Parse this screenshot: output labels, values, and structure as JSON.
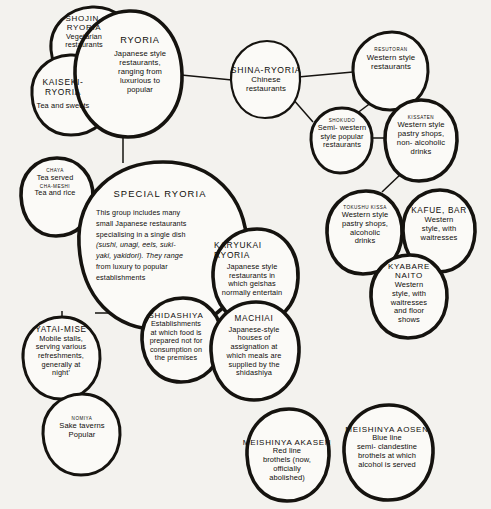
{
  "diagram": {
    "type": "venn-network",
    "background_color": "#f3f2ee",
    "ink_color": "#15130f",
    "nodes": [
      {
        "id": "shojin",
        "caption": "",
        "title": "SHOJIN-\nRYORIA",
        "body": "Vegetarian\nrestaurants"
      },
      {
        "id": "kaiseki",
        "caption": "",
        "title": "KAISEKI-\nRYORIA",
        "body": "Tea and sweets"
      },
      {
        "id": "ryoria",
        "caption": "",
        "title": "RYORIA",
        "body": "Japanese style\nrestaurants,\nranging from\nluxurious to\npopular"
      },
      {
        "id": "shina",
        "caption": "",
        "title": "SHINA-RYORIA",
        "body": "Chinese\nrestaurants"
      },
      {
        "id": "resutoran",
        "caption": "RESUTORAN",
        "title": "",
        "body": "Western style\nrestaurants"
      },
      {
        "id": "shokudo",
        "caption": "SHOKUDO",
        "title": "",
        "body": "Semi- western\nstyle popular\nrestaurants"
      },
      {
        "id": "kissaten",
        "caption": "KISSATEN",
        "title": "",
        "body": "Western style\npastry shops,\nnon- alcoholic\ndrinks"
      },
      {
        "id": "tokushu",
        "caption": "TOKUSHU KISSA",
        "title": "",
        "body": "Western style\npastry shops,\nalcoholic\ndrinks"
      },
      {
        "id": "kafue",
        "caption": "",
        "title": "KAFUE, BAR",
        "body": "Western\nstyle, with\nwaitresses"
      },
      {
        "id": "kyabare",
        "caption": "",
        "title": "KYABARE\nNAITO",
        "body": "Western\nstyle, with\nwaitresses\nand floor\nshows"
      },
      {
        "id": "chaya",
        "caption": "CHAYA",
        "title": "",
        "body": "Tea served",
        "caption2": "CHA-MESHI",
        "body2": "Tea and rice"
      },
      {
        "id": "special",
        "caption": "",
        "title": "SPECIAL  RYORIA",
        "body_lines": [
          "This group includes many",
          "small Japanese restaurants",
          "specialising in a single dish",
          "(sushi, unagi, eels, suki-",
          "yaki, yakidori). They range",
          "from luxury to popular",
          "establishments"
        ],
        "italic_lines": [
          3,
          4
        ]
      },
      {
        "id": "karyukai",
        "caption": "",
        "title": "KARYUKAI\nRYORIA",
        "body": "Japanese style\nrestaurants in\nwhich geishas\nnormally entertain"
      },
      {
        "id": "shidashiya",
        "caption": "",
        "title": "SHIDASHIYA",
        "body": "Establishments\nat which food is\nprepared not for\nconsumption on\nthe premises"
      },
      {
        "id": "machiai",
        "caption": "",
        "title": "MACHIAI",
        "body": "Japanese-style\nhouses of\nassignation at\nwhich meals are\nsupplied by the\nshidashiya"
      },
      {
        "id": "yatai",
        "caption": "",
        "title": "YATAI-MISE",
        "body": "Mobile stalls,\nserving various\nrefreshments,\ngenerally at\nnight'"
      },
      {
        "id": "nomiya",
        "caption": "NOMIYA",
        "title": "",
        "body": "Sake taverns\nPopular"
      },
      {
        "id": "akasen",
        "caption": "",
        "title": "MEISHINYA AKASEN",
        "body": "Red line\nbrothels (now,\nofficially\nabolished)"
      },
      {
        "id": "aosen",
        "caption": "",
        "title": "MEISHINYA AOSEN",
        "body": "Blue line\nsemi- clandestine\nbrothels at which\nalcohol is served"
      }
    ],
    "links": [
      {
        "from": "ryoria",
        "to": "shina"
      },
      {
        "from": "shina",
        "to": "resutoran"
      },
      {
        "from": "shina",
        "to": "shokudo"
      },
      {
        "from": "resutoran",
        "to": "shokudo"
      },
      {
        "from": "shokudo",
        "to": "kissaten"
      },
      {
        "from": "kissaten",
        "to": "tokushu"
      },
      {
        "from": "ryoria",
        "to": "special"
      },
      {
        "from": "special",
        "to": "yatai"
      },
      {
        "from": "special",
        "to": "shidashiya"
      },
      {
        "from": "yatai",
        "to": "nomiya"
      }
    ]
  }
}
